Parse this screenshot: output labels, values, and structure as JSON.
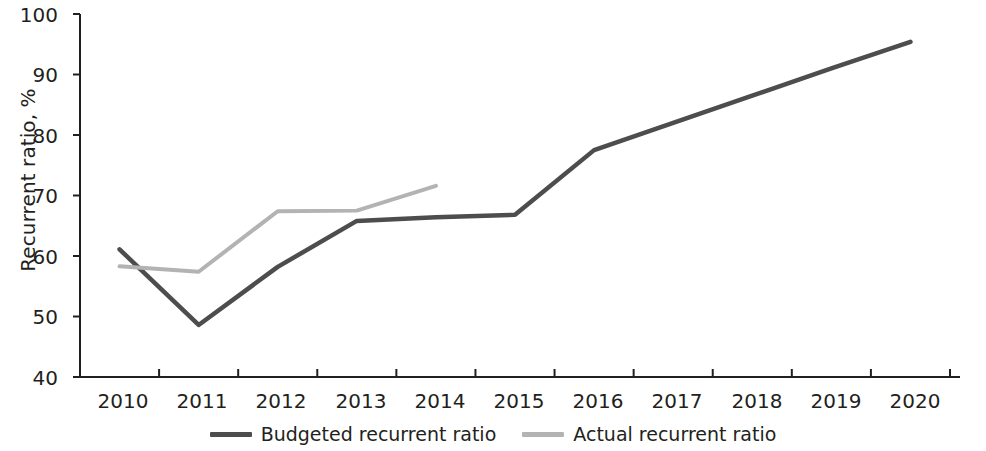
{
  "chart_data": {
    "type": "line",
    "title": "",
    "xlabel": "",
    "ylabel": "Recurrent ratio, %",
    "categories": [
      "2010",
      "2011",
      "2012",
      "2013",
      "2014",
      "2015",
      "2016",
      "2017",
      "2018",
      "2019",
      "2020"
    ],
    "x": [
      2010,
      2011,
      2012,
      2013,
      2014,
      2015,
      2016,
      2017,
      2018,
      2019,
      2020
    ],
    "xlim": [
      2010,
      2020
    ],
    "ylim": [
      40,
      100
    ],
    "yticks": [
      40,
      50,
      60,
      70,
      80,
      90,
      100
    ],
    "grid": false,
    "legend_position": "bottom-center",
    "series": [
      {
        "name": "Budgeted recurrent ratio",
        "color": "#4d4d4d",
        "x": [
          2010,
          2011,
          2012,
          2013,
          2014,
          2015,
          2016,
          2017,
          2018,
          2019,
          2020
        ],
        "values": [
          61.1,
          48.6,
          58.2,
          65.8,
          66.4,
          66.8,
          77.5,
          82.0,
          86.5,
          91.0,
          95.4
        ]
      },
      {
        "name": "Actual recurrent ratio",
        "color": "#b3b3b3",
        "x": [
          2010,
          2011,
          2012,
          2013,
          2014
        ],
        "values": [
          58.3,
          57.4,
          67.4,
          67.5,
          71.6
        ]
      }
    ]
  },
  "axis": {
    "y_tick_labels": [
      "100",
      "90",
      "80",
      "70",
      "60",
      "50",
      "40"
    ],
    "y_axis_title": "Recurrent ratio, %",
    "x_tick_labels": [
      "2010",
      "2011",
      "2012",
      "2013",
      "2014",
      "2015",
      "2016",
      "2017",
      "2018",
      "2019",
      "2020"
    ]
  },
  "legend": {
    "items": [
      {
        "label": "Budgeted recurrent ratio",
        "color": "#4d4d4d"
      },
      {
        "label": "Actual recurrent ratio",
        "color": "#b3b3b3"
      }
    ]
  }
}
